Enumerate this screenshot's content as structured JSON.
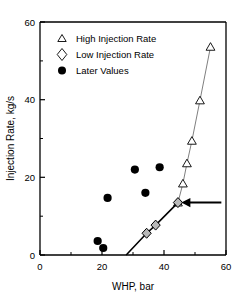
{
  "chart_data": {
    "type": "scatter",
    "title": "",
    "xlabel": "WHP, bar",
    "ylabel": "Injection Rate, kg/s",
    "xlim": [
      0,
      60
    ],
    "ylim": [
      0,
      60
    ],
    "xticks": [
      0,
      20,
      40,
      60
    ],
    "yticks": [
      0,
      20,
      40,
      60
    ],
    "xtick_labels": [
      "0",
      "20",
      "40",
      "60"
    ],
    "ytick_labels": [
      "0",
      "20",
      "40",
      "60"
    ],
    "grid": false,
    "legend_position": "top-left",
    "series": [
      {
        "name": "High Injection Rate",
        "marker": "triangle-open",
        "color": "#000000",
        "line": true,
        "line_color": "#808080",
        "points": [
          {
            "x": 44.5,
            "y": 13.5
          },
          {
            "x": 46.1,
            "y": 18.4
          },
          {
            "x": 47.4,
            "y": 23.6
          },
          {
            "x": 49.0,
            "y": 29.4
          },
          {
            "x": 51.6,
            "y": 39.8
          },
          {
            "x": 55.0,
            "y": 53.6
          }
        ]
      },
      {
        "name": "Low Injection Rate",
        "marker": "diamond-filled-gray",
        "color": "#b0b0b0",
        "line": true,
        "line_color": "#000000",
        "points": [
          {
            "x": 27.8,
            "y": 0.0
          },
          {
            "x": 34.4,
            "y": 5.6
          },
          {
            "x": 37.3,
            "y": 7.7
          },
          {
            "x": 44.5,
            "y": 13.5
          }
        ]
      },
      {
        "name": "Later Values",
        "marker": "circle-filled",
        "color": "#000000",
        "line": false,
        "points": [
          {
            "x": 18.6,
            "y": 3.6
          },
          {
            "x": 20.4,
            "y": 1.8
          },
          {
            "x": 21.8,
            "y": 14.7
          },
          {
            "x": 30.6,
            "y": 22.0
          },
          {
            "x": 34.0,
            "y": 16.0
          },
          {
            "x": 38.6,
            "y": 22.6
          }
        ]
      }
    ],
    "annotations": [
      {
        "type": "arrow",
        "points_to": {
          "x": 45.6,
          "y": 13.5
        },
        "tail": {
          "x": 58.5,
          "y": 13.5
        },
        "direction": "left",
        "color": "#000000"
      }
    ]
  },
  "legend": {
    "items": [
      {
        "label": "High Injection Rate",
        "marker": "triangle-open"
      },
      {
        "label": "Low Injection Rate",
        "marker": "diamond-open"
      },
      {
        "label": "Later Values",
        "marker": "circle-filled"
      }
    ]
  },
  "axes": {
    "x_title": "WHP, bar",
    "y_title": "Injection Rate, kg/s",
    "x_tick_labels": [
      "0",
      "20",
      "40",
      "60"
    ],
    "y_tick_labels": [
      "0",
      "20",
      "40",
      "60"
    ]
  }
}
